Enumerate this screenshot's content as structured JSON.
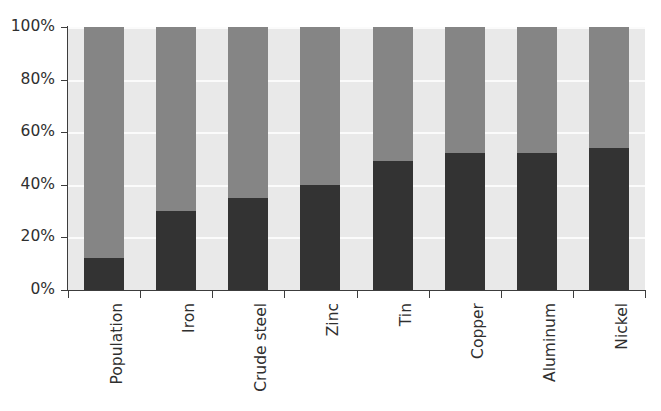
{
  "chart_data": {
    "type": "bar",
    "title": "",
    "subtitle": "",
    "xlabel": "",
    "ylabel": "",
    "stacked": true,
    "stack_total": 100,
    "grid": true,
    "legend": "none",
    "ylim": [
      0,
      100
    ],
    "ytick_labels": [
      "0%",
      "20%",
      "40%",
      "60%",
      "80%",
      "100%"
    ],
    "ytick_values": [
      0,
      20,
      40,
      60,
      80,
      100
    ],
    "categories": [
      "Population",
      "Iron",
      "Crude steel",
      "Zinc",
      "Tin",
      "Copper",
      "Aluminum",
      "Nickel"
    ],
    "series": [
      {
        "name": "lower-segment",
        "color": "#333333",
        "values": [
          12,
          30,
          35,
          40,
          49,
          52,
          52,
          54
        ]
      },
      {
        "name": "upper-segment",
        "color": "#858585",
        "values": [
          88,
          70,
          65,
          60,
          51,
          48,
          48,
          46
        ]
      }
    ],
    "colors": {
      "plot_background": "#e9e9e9",
      "gridline": "#fbfbfb",
      "axis": "#3c3c3c",
      "tick_text": "#2f2f2f",
      "figure_background": "#ffffff"
    }
  }
}
